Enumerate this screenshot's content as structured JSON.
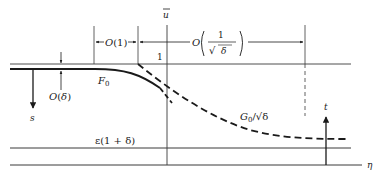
{
  "diagram": {
    "colors": {
      "ink": "#1a1a1a",
      "thin": "#3a3a3a",
      "background": "#ffffff"
    },
    "labels": {
      "u_bar": "u",
      "one": "1",
      "O_one": "O(1)",
      "O_prefix": "O",
      "frac_num": "1",
      "frac_den_sqrt": "√",
      "frac_den_var": "δ",
      "O_delta": "O(δ)",
      "F0_main": "F",
      "F0_sub": "0",
      "G0_main": "G",
      "G0_sub": "0",
      "G0_rest": "/√δ",
      "s": "s",
      "t": "t",
      "eps": "ε(1 + δ)",
      "eta": "η"
    }
  }
}
